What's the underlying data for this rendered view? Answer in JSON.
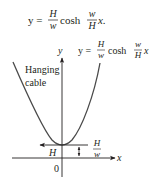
{
  "equation_top": {
    "lhs": "y =",
    "frac1": {
      "num": "H",
      "den": "w"
    },
    "func": "cosh",
    "frac2": {
      "num": "w",
      "den": "H"
    },
    "tail": "x."
  },
  "diagram": {
    "curve_label": {
      "lhs": "y =",
      "frac1": {
        "num": "H",
        "den": "w"
      },
      "func": "cosh",
      "frac2": {
        "num": "w",
        "den": "H"
      },
      "tail": "x"
    },
    "cable_label": [
      "Hanging",
      "cable"
    ],
    "y_axis_label": "y",
    "x_axis_label": "x",
    "origin_label": "0",
    "tension_label": "H",
    "height_label": {
      "num": "H",
      "den": "w"
    }
  },
  "colors": {
    "ink": "#231f20",
    "curve": "#4a4a4a",
    "background": "#ffffff"
  }
}
